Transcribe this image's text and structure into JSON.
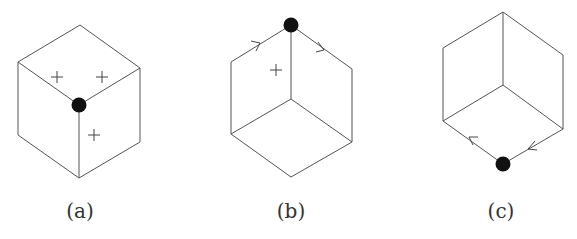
{
  "figure": {
    "panels": [
      {
        "id": "a",
        "label": "(a)",
        "dot_vertex": "center",
        "plus_marks": 3,
        "arrows": []
      },
      {
        "id": "b",
        "label": "(b)",
        "dot_vertex": "top",
        "plus_marks": 1,
        "arrows": [
          {
            "edge": "upper-left-to-top",
            "direction": "toward-dot"
          },
          {
            "edge": "top-to-upper-right",
            "direction": "away-from-dot"
          }
        ]
      },
      {
        "id": "c",
        "label": "(c)",
        "dot_vertex": "bottom",
        "plus_marks": 0,
        "arrows": [
          {
            "edge": "bottom-to-lower-left",
            "direction": "away-from-dot"
          },
          {
            "edge": "lower-right-to-bottom",
            "direction": "toward-dot"
          }
        ]
      }
    ],
    "colors": {
      "edge": "#555555",
      "dot": "#111111",
      "text": "#333333",
      "background": "#ffffff"
    }
  }
}
